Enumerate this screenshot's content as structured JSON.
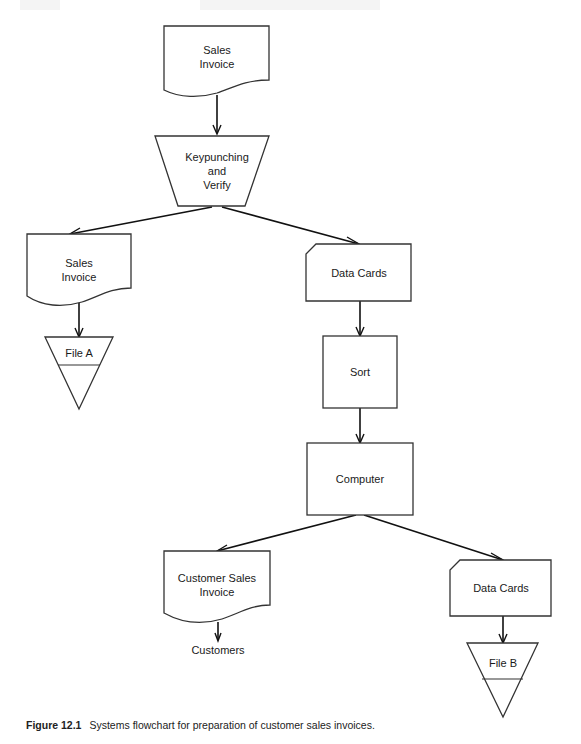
{
  "diagram": {
    "type": "systems-flowchart",
    "nodes": [
      {
        "id": "n1",
        "shape": "document",
        "label_lines": [
          "Sales",
          "Invoice"
        ]
      },
      {
        "id": "n2",
        "shape": "manual-operation",
        "label_lines": [
          "Keypunching",
          "and",
          "Verify"
        ]
      },
      {
        "id": "n3",
        "shape": "document",
        "label_lines": [
          "Sales",
          "Invoice"
        ]
      },
      {
        "id": "n4",
        "shape": "offline-storage",
        "label_lines": [
          "File  A"
        ]
      },
      {
        "id": "n5",
        "shape": "punched-card",
        "label_lines": [
          "Data  Cards"
        ]
      },
      {
        "id": "n6",
        "shape": "process",
        "label_lines": [
          "Sort"
        ]
      },
      {
        "id": "n7",
        "shape": "process",
        "label_lines": [
          "Computer"
        ]
      },
      {
        "id": "n8",
        "shape": "document",
        "label_lines": [
          "Customer  Sales",
          "Invoice"
        ]
      },
      {
        "id": "n9",
        "shape": "terminal-text",
        "label_lines": [
          "Customers"
        ]
      },
      {
        "id": "n10",
        "shape": "punched-card",
        "label_lines": [
          "Data  Cards"
        ]
      },
      {
        "id": "n11",
        "shape": "offline-storage",
        "label_lines": [
          "File  B"
        ]
      }
    ],
    "edges": [
      {
        "from": "n1",
        "to": "n2"
      },
      {
        "from": "n2",
        "to": "n3"
      },
      {
        "from": "n2",
        "to": "n5"
      },
      {
        "from": "n3",
        "to": "n4"
      },
      {
        "from": "n5",
        "to": "n6"
      },
      {
        "from": "n6",
        "to": "n7"
      },
      {
        "from": "n7",
        "to": "n8"
      },
      {
        "from": "n7",
        "to": "n10"
      },
      {
        "from": "n8",
        "to": "n9"
      },
      {
        "from": "n10",
        "to": "n11"
      }
    ]
  },
  "labels": {
    "n1_line1": "Sales",
    "n1_line2": "Invoice",
    "n2_line1": "Keypunching",
    "n2_line2": "and",
    "n2_line3": "Verify",
    "n3_line1": "Sales",
    "n3_line2": "Invoice",
    "n4": "File  A",
    "n5": "Data  Cards",
    "n6": "Sort",
    "n7": "Computer",
    "n8_line1": "Customer  Sales",
    "n8_line2": "Invoice",
    "n9": "Customers",
    "n10": "Data  Cards",
    "n11": "File  B"
  },
  "caption": {
    "figure_label": "Figure 12.1",
    "text": "Systems flowchart for preparation of customer sales invoices."
  },
  "colors": {
    "stroke": "#333333",
    "background": "#ffffff"
  }
}
